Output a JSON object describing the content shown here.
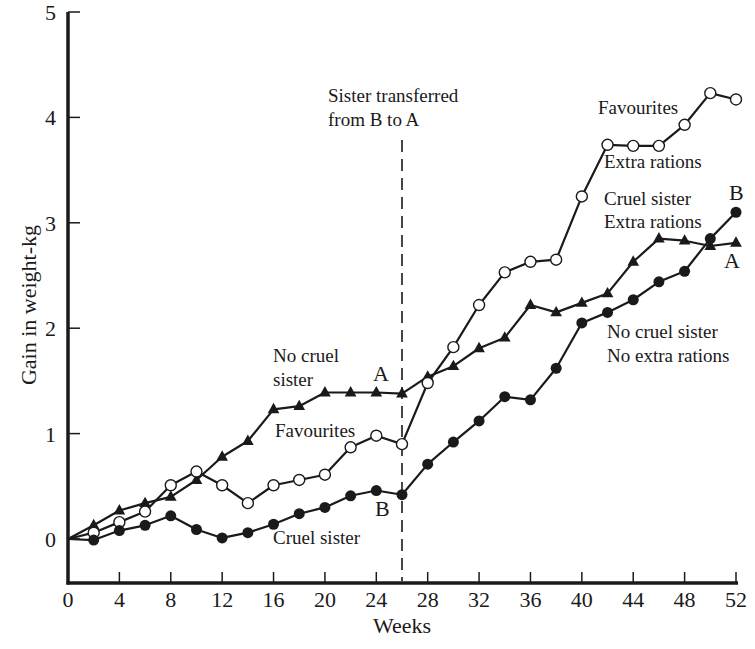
{
  "chart_data": {
    "type": "line",
    "title": "",
    "xlabel": "Weeks",
    "ylabel": "Gain in weight-kg",
    "xlim": [
      0,
      52
    ],
    "ylim": [
      -0.4,
      5
    ],
    "x_ticks": [
      0,
      4,
      8,
      12,
      16,
      20,
      24,
      28,
      32,
      36,
      40,
      44,
      48,
      52
    ],
    "y_ticks": [
      0,
      1,
      2,
      3,
      4,
      5
    ],
    "grid": false,
    "x": [
      0,
      2,
      4,
      6,
      8,
      10,
      12,
      14,
      16,
      18,
      20,
      22,
      24,
      26,
      28,
      30,
      32,
      34,
      36,
      38,
      40,
      42,
      44,
      46,
      48,
      50,
      52
    ],
    "series": [
      {
        "name": "A: No cruel sister (later Cruel sister, Extra rations)",
        "marker": "filled-triangle",
        "values": [
          0,
          0.13,
          0.27,
          0.34,
          0.4,
          0.56,
          0.78,
          0.93,
          1.23,
          1.26,
          1.39,
          1.39,
          1.39,
          1.38,
          1.54,
          1.64,
          1.81,
          1.91,
          2.22,
          2.15,
          2.24,
          2.33,
          2.63,
          2.85,
          2.83,
          2.78,
          2.81
        ]
      },
      {
        "name": "Favourites (later Favourites, Extra rations)",
        "marker": "open-circle",
        "values": [
          0,
          0.06,
          0.16,
          0.26,
          0.51,
          0.64,
          0.51,
          0.34,
          0.51,
          0.56,
          0.61,
          0.87,
          0.98,
          0.9,
          1.48,
          1.82,
          2.22,
          2.53,
          2.63,
          2.65,
          3.25,
          3.74,
          3.73,
          3.73,
          3.93,
          4.23,
          4.17
        ]
      },
      {
        "name": "B: Cruel sister (later No cruel sister, No extra rations)",
        "marker": "filled-circle",
        "values": [
          0,
          -0.01,
          0.08,
          0.13,
          0.22,
          0.09,
          0.01,
          0.06,
          0.14,
          0.24,
          0.3,
          0.41,
          0.46,
          0.42,
          0.71,
          0.92,
          1.12,
          1.35,
          1.32,
          1.62,
          2.05,
          2.15,
          2.27,
          2.44,
          2.54,
          2.85,
          3.1
        ]
      }
    ],
    "annotations": [
      {
        "text": "Sister transferred",
        "x": 328,
        "y": 102,
        "kind": "annot"
      },
      {
        "text": "from B to A",
        "x": 328,
        "y": 126,
        "kind": "annot"
      },
      {
        "text": "No cruel",
        "x": 273,
        "y": 362,
        "kind": "annot"
      },
      {
        "text": "sister",
        "x": 273,
        "y": 386,
        "kind": "annot"
      },
      {
        "text": "A",
        "x": 373,
        "y": 381,
        "kind": "letter"
      },
      {
        "text": "Favourites",
        "x": 275,
        "y": 437,
        "kind": "annot"
      },
      {
        "text": "B",
        "x": 375,
        "y": 516,
        "kind": "letter"
      },
      {
        "text": "Cruel sister",
        "x": 273,
        "y": 544,
        "kind": "annot"
      },
      {
        "text": "Favourites",
        "x": 598,
        "y": 114,
        "kind": "annot"
      },
      {
        "text": "Extra rations",
        "x": 604,
        "y": 168,
        "kind": "annot"
      },
      {
        "text": "Cruel sister",
        "x": 604,
        "y": 205,
        "kind": "annot"
      },
      {
        "text": "Extra rations",
        "x": 604,
        "y": 228,
        "kind": "annot"
      },
      {
        "text": "B",
        "x": 729,
        "y": 200,
        "kind": "letter"
      },
      {
        "text": "A",
        "x": 724,
        "y": 268,
        "kind": "letter"
      },
      {
        "text": "No cruel sister",
        "x": 607,
        "y": 338,
        "kind": "annot"
      },
      {
        "text": "No extra rations",
        "x": 607,
        "y": 362,
        "kind": "annot"
      }
    ],
    "transfer_week": 26,
    "colors": {
      "ink": "#1a1a1a",
      "background": "#ffffff"
    }
  }
}
